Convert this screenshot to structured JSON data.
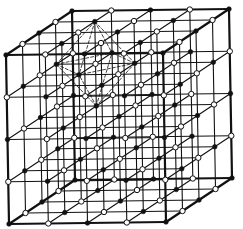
{
  "diagram": {
    "kind": "cubic lattice with alternating atom species and octahedral coordination",
    "lattice_points_per_edge": 5,
    "species": [
      {
        "name": "species-a",
        "style": "filled",
        "color": "#111111"
      },
      {
        "name": "species-b",
        "style": "open",
        "color": "#ffffff"
      }
    ],
    "origin_species": "species-a",
    "highlight": {
      "shape": "octahedron",
      "line_style": "dashed",
      "center_index": [
        1,
        3,
        3
      ],
      "vertex_species": "species-b"
    },
    "colors": {
      "line": "#111111",
      "background": "#ffffff"
    }
  }
}
